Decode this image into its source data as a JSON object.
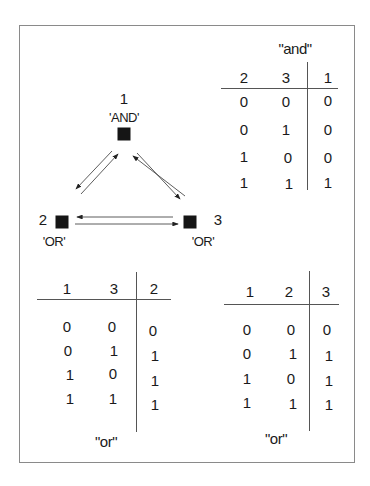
{
  "diagram": {
    "nodes": [
      {
        "id": "1",
        "label": "1",
        "gate": "'AND'"
      },
      {
        "id": "2",
        "label": "2",
        "gate": "'OR'"
      },
      {
        "id": "3",
        "label": "3",
        "gate": "'OR'"
      }
    ],
    "edges": [
      {
        "from": "1",
        "to": "2"
      },
      {
        "from": "2",
        "to": "1"
      },
      {
        "from": "1",
        "to": "3"
      },
      {
        "from": "3",
        "to": "1"
      },
      {
        "from": "2",
        "to": "3"
      },
      {
        "from": "3",
        "to": "2"
      }
    ]
  },
  "tables": {
    "and": {
      "title": "\"and\"",
      "headers": [
        "2",
        "3",
        "1"
      ],
      "rows": [
        [
          "0",
          "0",
          "0"
        ],
        [
          "0",
          "1",
          "0"
        ],
        [
          "1",
          "0",
          "0"
        ],
        [
          "1",
          "1",
          "1"
        ]
      ]
    },
    "or_left": {
      "title": "\"or\"",
      "headers": [
        "1",
        "3",
        "2"
      ],
      "rows": [
        [
          "0",
          "0",
          "0"
        ],
        [
          "0",
          "1",
          "1"
        ],
        [
          "1",
          "0",
          "1"
        ],
        [
          "1",
          "1",
          "1"
        ]
      ]
    },
    "or_right": {
      "title": "\"or\"",
      "headers": [
        "1",
        "2",
        "3"
      ],
      "rows": [
        [
          "0",
          "0",
          "0"
        ],
        [
          "0",
          "1",
          "1"
        ],
        [
          "1",
          "0",
          "1"
        ],
        [
          "1",
          "1",
          "1"
        ]
      ]
    }
  }
}
